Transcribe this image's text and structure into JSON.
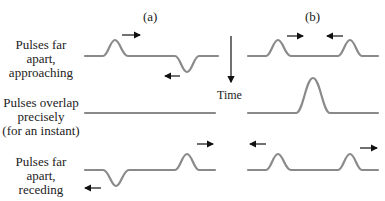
{
  "figure": {
    "column_labels": [
      "(a)",
      "(b)"
    ],
    "time_label": "Time",
    "rows": [
      {
        "label_lines": [
          "Pulses far apart,",
          "approaching"
        ]
      },
      {
        "label_lines": [
          "Pulses overlap",
          "precisely",
          "(for an instant)"
        ]
      },
      {
        "label_lines": [
          "Pulses far apart,",
          "receding"
        ]
      }
    ],
    "colors": {
      "wave": "#8a8a8a",
      "arrow": "#111111",
      "text": "#222222"
    }
  }
}
